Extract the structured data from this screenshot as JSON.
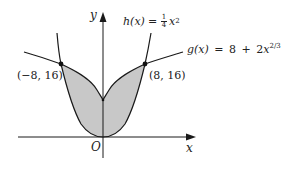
{
  "figure": {
    "axes": {
      "x_label": "x",
      "y_label": "y",
      "origin_label": "O"
    },
    "curves": [
      {
        "name": "h",
        "lhs": "h(x)",
        "equals": "=",
        "coef_num": "1",
        "coef_den": "4",
        "var": "x",
        "exp": "2"
      },
      {
        "name": "g",
        "lhs": "g(x)",
        "equals": "=",
        "const": "8",
        "plus": "+",
        "coef": "2",
        "var": "x",
        "exp": "2/3"
      }
    ],
    "points": [
      {
        "label": "(−8, 16)",
        "x": -8,
        "y": 16
      },
      {
        "label": "(8, 16)",
        "x": 8,
        "y": 16
      }
    ],
    "region": "shaded area between h(x) and g(x) for −8 ≤ x ≤ 8",
    "colors": {
      "stroke": "#1a1a1a",
      "fill": "#c8c8c8",
      "background": "#ffffff"
    }
  }
}
